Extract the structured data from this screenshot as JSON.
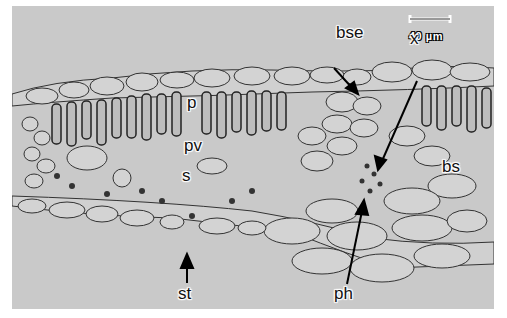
{
  "figure": {
    "background_color": "#c9c9c9",
    "scale_bar": {
      "label": "40 µm"
    },
    "labels": [
      {
        "id": "bse",
        "text": "bse",
        "x": 336,
        "y": 52
      },
      {
        "id": "x",
        "text": "x",
        "x": 410,
        "y": 58
      },
      {
        "id": "p",
        "text": "p",
        "x": 175,
        "y": 121
      },
      {
        "id": "pv",
        "text": "pv",
        "x": 174,
        "y": 165
      },
      {
        "id": "s",
        "text": "s",
        "x": 172,
        "y": 196
      },
      {
        "id": "bs",
        "text": "bs",
        "x": 430,
        "y": 186
      },
      {
        "id": "st",
        "text": "st",
        "x": 178,
        "y": 284
      },
      {
        "id": "ph",
        "text": "ph",
        "x": 335,
        "y": 284
      }
    ]
  }
}
